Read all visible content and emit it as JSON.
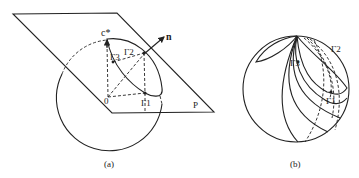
{
  "figure_a": {
    "caption": "(a)",
    "plane_label": "P",
    "normal_label": "n",
    "reciprocal_axis_label": "c*",
    "origin_label": "0",
    "points": {
      "gamma1": "Γ1",
      "gamma2": "Γ2",
      "gamma3": "Γ3"
    }
  },
  "figure_b": {
    "caption": "(b)",
    "points": {
      "gamma1": "Γ1",
      "gamma2": "Γ2",
      "gamma3": "Γ3"
    }
  },
  "colors": {
    "ink": "#222222",
    "background": "#ffffff"
  }
}
